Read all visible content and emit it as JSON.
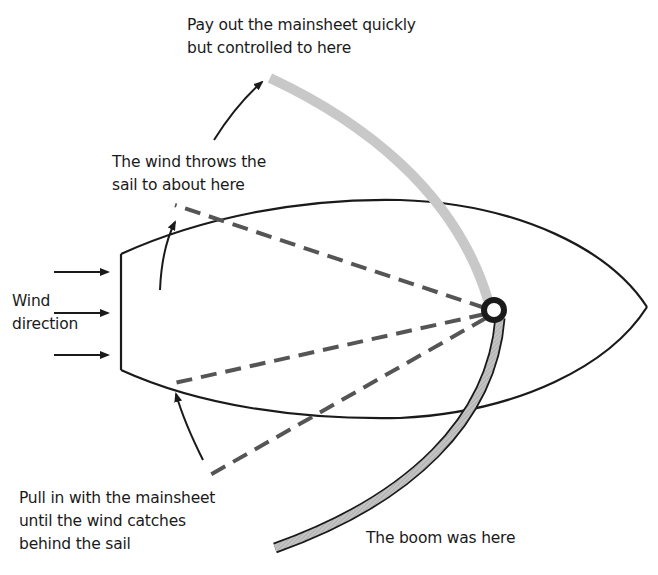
{
  "diagram": {
    "type": "sailing-gybe-diagram",
    "labels": {
      "top": {
        "line1": "Pay out the mainsheet quickly",
        "line2": "but controlled to here"
      },
      "middle": {
        "line1": "The wind throws the",
        "line2": "sail to about here"
      },
      "wind": {
        "line1": "Wind",
        "line2": "direction"
      },
      "bottom_left": {
        "line1": "Pull in with the mainsheet",
        "line2": "until the wind catches",
        "line3": "behind the sail"
      },
      "boom": {
        "line1": "The boom was here"
      }
    },
    "colors": {
      "ink": "#1a1a1a",
      "boom_fill": "#b8b8b8",
      "boom_fill_light": "#c8c8c8",
      "dash": "#555555"
    },
    "elements": {
      "hull": "boat-hull-outline",
      "pivot": "mast-pivot-ring",
      "boom_arc": "boom-swing-arc",
      "sail_positions": [
        "thrown-position",
        "start-position",
        "pull-in-position"
      ],
      "wind_arrows": 3
    }
  }
}
